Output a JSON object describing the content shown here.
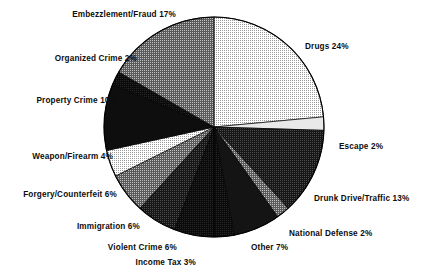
{
  "chart_data": {
    "type": "pie",
    "title": "",
    "subtitle": "",
    "xlabel": "",
    "ylabel": "",
    "legend_position": "none",
    "grid": false,
    "units": "percent",
    "label_format": "{name} {value}%",
    "start_angle_deg": -90,
    "direction": "clockwise",
    "categories": [
      "Drugs",
      "Escape",
      "Drunk Drive/Traffic",
      "National Defense",
      "Other",
      "Income Tax",
      "Violent Crime",
      "Immigration",
      "Forgery/Counterfeit",
      "Weapon/Firearm",
      "Property Crime",
      "Organized Crime",
      "Embezzlement/Fraud"
    ],
    "values": [
      24,
      2,
      13,
      2,
      7,
      3,
      6,
      6,
      6,
      4,
      10,
      2,
      17
    ],
    "total": 102,
    "slices": [
      {
        "name": "Drugs",
        "value": 24,
        "label": "Drugs 24%",
        "fill": "#d4d4d4"
      },
      {
        "name": "Escape",
        "value": 2,
        "label": "Escape 2%",
        "fill": "#e6e6e6"
      },
      {
        "name": "Drunk Drive/Traffic",
        "value": 13,
        "label": "Drunk Drive/Traffic 13%",
        "fill": "#3a3a3a"
      },
      {
        "name": "National Defense",
        "value": 2,
        "label": "National Defense 2%",
        "fill": "#8c8c8c"
      },
      {
        "name": "Other",
        "value": 7,
        "label": "Other 7%",
        "fill": "#141414"
      },
      {
        "name": "Income Tax",
        "value": 3,
        "label": "Income Tax 3%",
        "fill": "#1f1f1f"
      },
      {
        "name": "Violent Crime",
        "value": 6,
        "label": "Violent Crime 6%",
        "fill": "#2b2b2b"
      },
      {
        "name": "Immigration",
        "value": 6,
        "label": "Immigration 6%",
        "fill": "#4a4a4a"
      },
      {
        "name": "Forgery/Counterfeit",
        "value": 6,
        "label": "Forgery/Counterfeit 6%",
        "fill": "#6e6e6e"
      },
      {
        "name": "Weapon/Firearm",
        "value": 4,
        "label": "Weapon/Firearm 4%",
        "fill": "#b4b4b4"
      },
      {
        "name": "Property Crime",
        "value": 10,
        "label": "Property Crime 10%",
        "fill": "#101010"
      },
      {
        "name": "Organized Crime",
        "value": 2,
        "label": "Organized Crime 2%",
        "fill": "#2e2e2e"
      },
      {
        "name": "Embezzlement/Fraud",
        "value": 17,
        "label": "Embezzlement/Fraud 17%",
        "fill": "#787878"
      }
    ]
  },
  "labels": {
    "embezzlement_fraud": "Embezzlement/Fraud 17%",
    "organized_crime": "Organized Crime 2%",
    "property_crime": "Property Crime 10%",
    "weapon_firearm": "Weapon/Firearm 4%",
    "forgery_counterfeit": "Forgery/Counterfeit 6%",
    "immigration": "Immigration 6%",
    "violent_crime": "Violent Crime 6%",
    "income_tax": "Income Tax 3%",
    "other": "Other 7%",
    "national_defense": "National Defense 2%",
    "drunk_drive_traffic": "Drunk Drive/Traffic 13%",
    "escape": "Escape 2%",
    "drugs": "Drugs 24%"
  },
  "colors": {
    "background": "#ffffff",
    "text": "#0d0d0d",
    "outline": "#000000"
  }
}
